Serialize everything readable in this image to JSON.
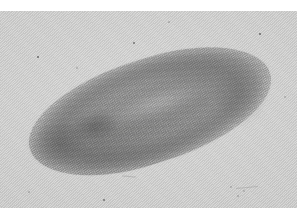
{
  "page": {
    "width": 307,
    "height": 224,
    "background_color": "#ffffff",
    "kind": "scanned-photographic-plate"
  },
  "caption": {
    "text": "clipped running text",
    "visible": "partially — cut off at top edge of scan",
    "color": "#e4e4e6"
  },
  "plate": {
    "label": "photomicrograph-plate",
    "background_color": "#d9d9d8",
    "left": 0,
    "top": 11,
    "width": 297,
    "height": 197,
    "texture": "diagonal halftone screen / paper grain"
  },
  "specimen": {
    "label": "flatworm-specimen",
    "common_description": "elongated dorsoventrally flattened worm, whole mount",
    "orientation": "diagonal, posterior at lower-left, anterior at upper-right",
    "body_color_dark": "#6a6a6a",
    "body_color_mid": "#8c8c8c",
    "body_color_light": "#bdbdbd",
    "features": [
      {
        "name": "anterior-head-end",
        "position": "upper-right, bluntly rounded"
      },
      {
        "name": "posterior-tail-end",
        "position": "lower-left, tapering"
      },
      {
        "name": "pale-midline",
        "position": "central long axis"
      },
      {
        "name": "pharynx-region",
        "position": "left of centre, darker mass"
      },
      {
        "name": "stippled-body-margin",
        "position": "continuous dark rim"
      },
      {
        "name": "gut-striations",
        "position": "fine transverse branches"
      }
    ]
  },
  "defects": {
    "label": "emulsion-dust-specks",
    "specks": [
      {
        "x": 134,
        "y": 43,
        "size": 2.4
      },
      {
        "x": 38,
        "y": 57,
        "size": 1.6
      },
      {
        "x": 77,
        "y": 68,
        "size": 1.3
      },
      {
        "x": 104,
        "y": 200,
        "size": 2.2
      },
      {
        "x": 29,
        "y": 192,
        "size": 1.2
      },
      {
        "x": 231,
        "y": 187,
        "size": 1.4
      },
      {
        "x": 244,
        "y": 191,
        "size": 1.3
      },
      {
        "x": 238,
        "y": 196,
        "size": 1.1
      },
      {
        "x": 260,
        "y": 34,
        "size": 1.5
      },
      {
        "x": 169,
        "y": 22,
        "size": 1.2
      },
      {
        "x": 285,
        "y": 97,
        "size": 1.4
      }
    ]
  },
  "margins": {
    "right_label": "page-right-margin",
    "bottom_label": "page-bottom-margin",
    "color": "#ffffff"
  }
}
